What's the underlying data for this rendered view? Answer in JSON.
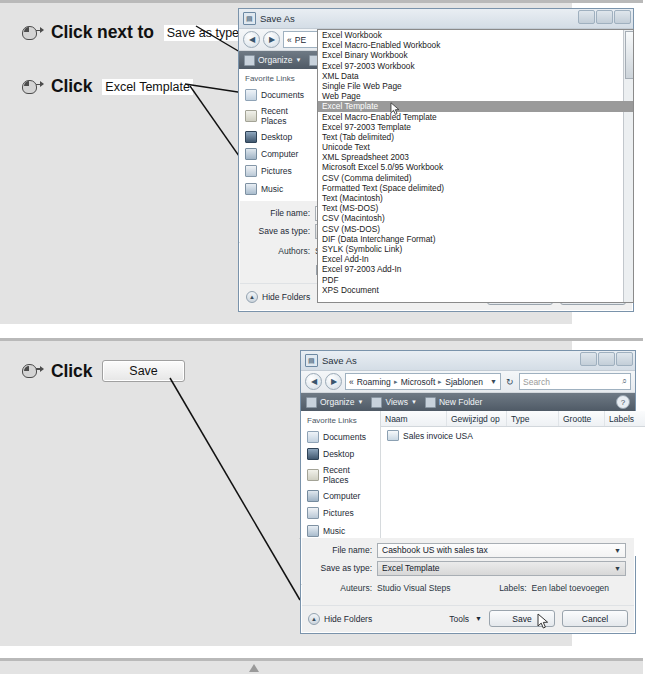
{
  "panels": [
    {
      "id": "panel-1",
      "instructions": [
        {
          "icon": "mouse-click-icon",
          "word": "Click next to",
          "chip": "Save as type:",
          "chip_style": "plain"
        },
        {
          "icon": "mouse-click-icon",
          "word": "Click",
          "chip": "Excel Template",
          "chip_style": "plain"
        }
      ],
      "dialog": {
        "title": "Save As",
        "title_icon": "save-as-icon",
        "breadcrumb": [
          "«",
          "PE"
        ],
        "search_placeholder": "",
        "toolbar": {
          "organize": "Organize",
          "views": "",
          "new_folder": ""
        },
        "sidebar": {
          "heading": "Favorite Links",
          "items": [
            "Documents",
            "Recent Places",
            "Desktop",
            "Computer",
            "Pictures",
            "Music",
            "Recently Changed"
          ],
          "more": "More",
          "folders": "Folders"
        },
        "dropdown": {
          "options": [
            "Excel Workbook",
            "Excel Macro-Enabled Workbook",
            "Excel Binary Workbook",
            "Excel 97-2003 Workbook",
            "XML Data",
            "Single File Web Page",
            "Web Page",
            "Excel Template",
            "Excel Macro-Enabled Template",
            "Excel 97-2003 Template",
            "Text (Tab delimited)",
            "Unicode Text",
            "XML Spreadsheet 2003",
            "Microsoft Excel 5.0/95 Workbook",
            "CSV (Comma delimited)",
            "Formatted Text (Space delimited)",
            "Text (Macintosh)",
            "Text (MS-DOS)",
            "CSV (Macintosh)",
            "CSV (MS-DOS)",
            "DIF (Data Interchange Format)",
            "SYLK (Symbolic Link)",
            "Excel Add-In",
            "Excel 97-2003 Add-In",
            "PDF",
            "XPS Document"
          ],
          "selected_index": 7
        },
        "form": {
          "filename_label": "File name:",
          "filename_value": "",
          "savetype_label": "Save as type:",
          "savetype_value": "Excel Workbook",
          "authors_label": "Authors:",
          "authors_value": "Studio Visual Steps",
          "tags_label": "Tags:",
          "tags_value": "Add a tag",
          "thumbnail_label": "Save Thumbnail"
        },
        "footer": {
          "hide_folders": "Hide Folders",
          "tools": "Tools",
          "save": "Save",
          "cancel": "Cancel"
        }
      }
    },
    {
      "id": "panel-2",
      "instructions": [
        {
          "icon": "mouse-click-icon",
          "word": "Click",
          "chip": "Save",
          "chip_style": "button"
        }
      ],
      "dialog": {
        "title": "Save As",
        "title_icon": "save-as-icon",
        "breadcrumb": [
          "«",
          "Roaming",
          "Microsoft",
          "Sjablonen"
        ],
        "search_placeholder": "Search",
        "toolbar": {
          "organize": "Organize",
          "views": "Views",
          "new_folder": "New Folder"
        },
        "sidebar": {
          "heading": "Favorite Links",
          "items": [
            "Documents",
            "Desktop",
            "Recent Places",
            "Computer",
            "Pictures",
            "Music",
            "Recently Changed"
          ],
          "more": "More",
          "folders": "Folders"
        },
        "filelist": {
          "columns": [
            "Naam",
            "Gewijzigd op",
            "Type",
            "Grootte",
            "Labels"
          ],
          "rows": [
            {
              "name": "Sales invoice USA",
              "modified": "",
              "type": "",
              "size": "",
              "labels": ""
            }
          ]
        },
        "form": {
          "filename_label": "File name:",
          "filename_value": "Cashbook US with sales tax",
          "savetype_label": "Save as type:",
          "savetype_value": "Excel Template",
          "authors_label": "Auteurs:",
          "authors_value": "Studio Visual Steps",
          "tags_label": "Labels:",
          "tags_value": "Een label toevoegen"
        },
        "footer": {
          "hide_folders": "Hide Folders",
          "tools": "Tools",
          "save": "Save",
          "cancel": "Cancel"
        }
      }
    }
  ],
  "colors": {
    "page_background": "#ffffff",
    "panel_background": "#e3e3e3",
    "dialog_background": "#f0f0f0",
    "selection": "#9a9a9a",
    "rule": "#b9b9b9"
  }
}
